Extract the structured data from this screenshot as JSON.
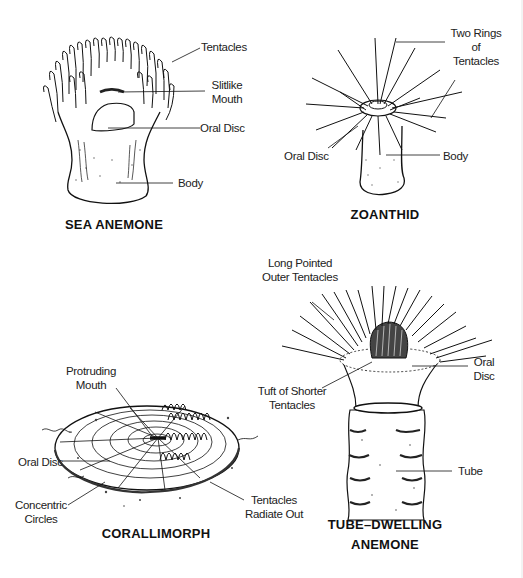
{
  "figures": [
    {
      "title": "SEA ANEMONE",
      "labels": [
        "Tentacles",
        "Slitlike Mouth",
        "Oral Disc",
        "Body"
      ]
    },
    {
      "title": "ZOANTHID",
      "labels": [
        "Two Rings of Tentacles",
        "Oral Disc",
        "Body"
      ]
    },
    {
      "title": "CORALLIMORPH",
      "labels": [
        "Protruding Mouth",
        "Oral Disc",
        "Concentric Circles",
        "Tentacles Radiate Out"
      ]
    },
    {
      "title_line1": "TUBE–DWELLING",
      "title_line2": "ANEMONE",
      "labels": [
        "Long Pointed Outer Tentacles",
        "Tuft of Shorter Tentacles",
        "Oral Disc",
        "Tube"
      ]
    }
  ],
  "sea_anemone": {
    "title": "SEA ANEMONE",
    "tentacles": "Tentacles",
    "mouth_l1": "Slitlike",
    "mouth_l2": "Mouth",
    "oral_disc": "Oral Disc",
    "body": "Body"
  },
  "zoanthid": {
    "title": "ZOANTHID",
    "rings_l1": "Two Rings",
    "rings_l2": "of",
    "rings_l3": "Tentacles",
    "oral_disc": "Oral Disc",
    "body": "Body"
  },
  "corallimorph": {
    "title": "CORALLIMORPH",
    "mouth_l1": "Protruding",
    "mouth_l2": "Mouth",
    "oral_disc": "Oral Disc",
    "circles_l1": "Concentric",
    "circles_l2": "Circles",
    "tentacles_l1": "Tentacles",
    "tentacles_l2": "Radiate Out"
  },
  "tube_anemone": {
    "title_l1": "TUBE–DWELLING",
    "title_l2": "ANEMONE",
    "outer_l1": "Long Pointed",
    "outer_l2": "Outer Tentacles",
    "tuft_l1": "Tuft of Shorter",
    "tuft_l2": "Tentacles",
    "disc_l1": "Oral",
    "disc_l2": "Disc",
    "tube": "Tube"
  }
}
